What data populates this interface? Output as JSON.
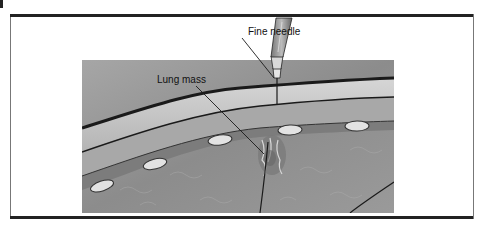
{
  "figure": {
    "type": "medical-illustration",
    "labels": {
      "needle": "Fine needle",
      "mass": "Lung mass"
    },
    "colors": {
      "outline": "#1a1a1a",
      "skin": "#c8c8c8",
      "tissue": "#9a9a9a",
      "lung": "#8e8e8e",
      "rib": "#e2e2e2",
      "border": "#222222"
    }
  }
}
